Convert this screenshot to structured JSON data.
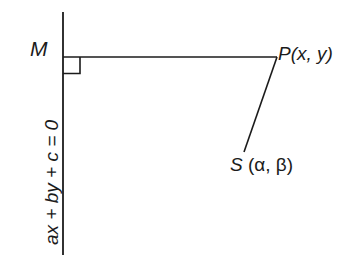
{
  "figure": {
    "type": "geometry-diagram",
    "background_color": "#ffffff",
    "stroke_color": "#1b1b1b",
    "labels": {
      "foot_point": "M",
      "point_p": "P(x, y)",
      "point_s_name": "S",
      "point_s_open_paren": "(",
      "point_s_alpha": "α",
      "point_s_comma": ", ",
      "point_s_beta": "β",
      "point_s_close_paren": ")",
      "line_equation": "ax + by + c = 0"
    },
    "geometry": {
      "vertical_line": {
        "x": 63,
        "y1": 12,
        "y2": 255
      },
      "horizontal_segment": {
        "x1": 63,
        "y1": 57,
        "x2": 277,
        "y2": 57
      },
      "slant_segment": {
        "x1": 277,
        "y1": 57,
        "x2": 244,
        "y2": 152
      },
      "right_angle_marker": {
        "x": 63,
        "y": 57,
        "size": 17
      },
      "stroke_width": 1.6
    }
  }
}
